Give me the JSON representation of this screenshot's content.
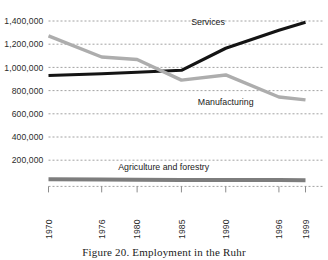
{
  "caption": "Figure 20. Employment in the Ruhr",
  "chart_data": {
    "type": "line",
    "title": "Employment in the Ruhr",
    "xlabel": "",
    "ylabel": "",
    "ylim": [
      0,
      1400000
    ],
    "xlim": [
      1970,
      1999
    ],
    "grid": true,
    "legend_position": "inline-annotations",
    "yticks": [
      200000,
      400000,
      600000,
      800000,
      1000000,
      1200000,
      1400000
    ],
    "ytick_labels": [
      "200,000",
      "400,000",
      "600,000",
      "800,000",
      "1,000,000",
      "1,200,000",
      "1,400,000"
    ],
    "xticks": [
      1970,
      1976,
      1980,
      1985,
      1990,
      1996,
      1999
    ],
    "xtick_labels": [
      "1970",
      "1976",
      "1980",
      "1985",
      "1990",
      "1996",
      "1999"
    ],
    "series": [
      {
        "name": "Services",
        "color": "#141414",
        "width": 3.1,
        "label_x": 1988,
        "label_y": 1368000,
        "x": [
          1970,
          1976,
          1980,
          1985,
          1990,
          1996,
          1999
        ],
        "values": [
          930000,
          945000,
          958000,
          975000,
          1165000,
          1320000,
          1390000
        ]
      },
      {
        "name": "Manufacturing",
        "color": "#adadad",
        "width": 3.4,
        "label_x": 1990,
        "label_y": 672000,
        "x": [
          1970,
          1976,
          1980,
          1985,
          1990,
          1996,
          1999
        ],
        "values": [
          1272000,
          1090000,
          1068000,
          890000,
          935000,
          745000,
          720000
        ]
      },
      {
        "name": "Agriculture and forestry",
        "color": "#7d7d7d",
        "width": 4.0,
        "label_x": 1983,
        "label_y": 118000,
        "x": [
          1970,
          1976,
          1980,
          1985,
          1990,
          1996,
          1999
        ],
        "values": [
          36000,
          33000,
          31000,
          30000,
          30000,
          29000,
          28000
        ]
      }
    ]
  }
}
